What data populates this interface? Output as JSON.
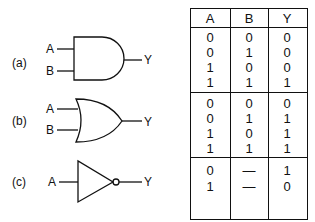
{
  "gates": [
    {
      "label": "(a)",
      "type": "AND",
      "inputs": [
        "A",
        "B"
      ],
      "output": "Y"
    },
    {
      "label": "(b)",
      "type": "OR",
      "inputs": [
        "A",
        "B"
      ],
      "output": "Y"
    },
    {
      "label": "(c)",
      "type": "NOT",
      "inputs": [
        "A"
      ],
      "output": "Y"
    }
  ],
  "truth_table": {
    "headers": [
      "A",
      "B",
      "Y"
    ],
    "sections": [
      {
        "rows": [
          [
            "0",
            "0",
            "0"
          ],
          [
            "0",
            "1",
            "0"
          ],
          [
            "1",
            "0",
            "0"
          ],
          [
            "1",
            "1",
            "1"
          ]
        ]
      },
      {
        "rows": [
          [
            "0",
            "0",
            "0"
          ],
          [
            "0",
            "1",
            "1"
          ],
          [
            "1",
            "0",
            "1"
          ],
          [
            "1",
            "1",
            "1"
          ]
        ]
      },
      {
        "rows": [
          [
            "0",
            "—",
            "1"
          ],
          [
            "1",
            "—",
            "0"
          ]
        ]
      }
    ]
  }
}
